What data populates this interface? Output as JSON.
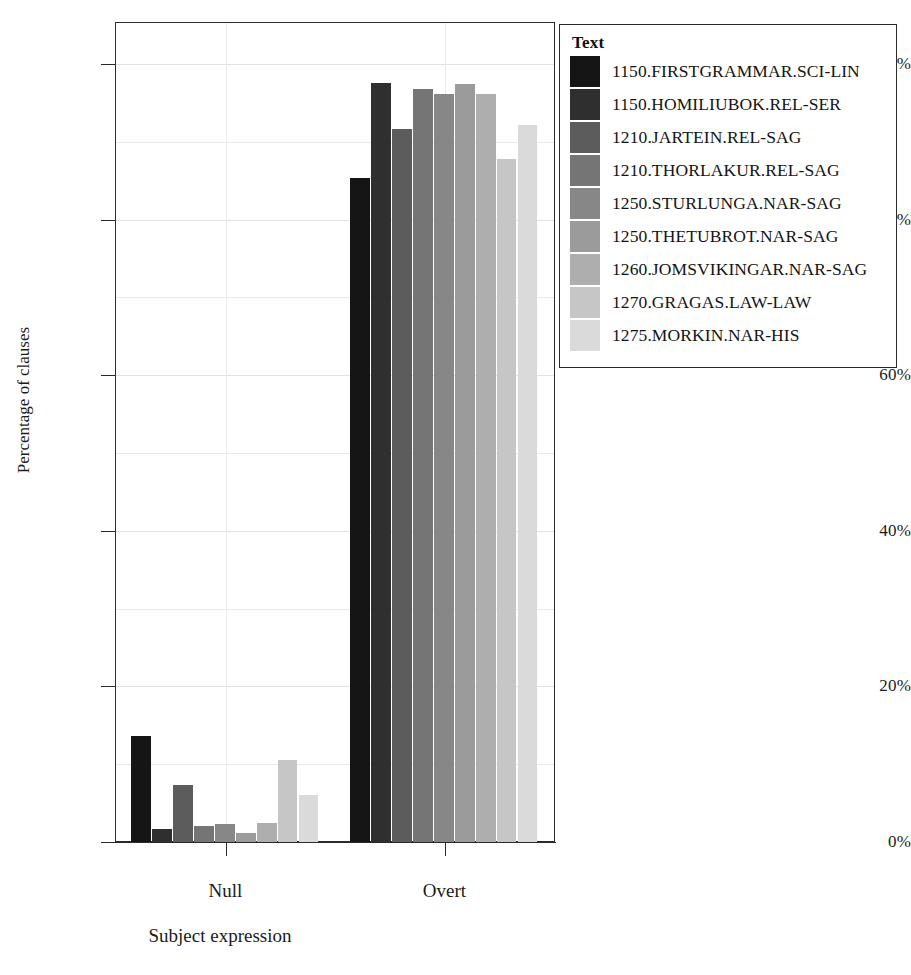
{
  "chart_data": {
    "type": "bar",
    "title": "",
    "xlabel": "Subject expression",
    "ylabel": "Percentage of clauses",
    "categories": [
      "Null",
      "Overt"
    ],
    "ylim": [
      0,
      100
    ],
    "ytick_labels": [
      "0%",
      "20%",
      "40%",
      "60%",
      "80%",
      "100%"
    ],
    "ytick_values": [
      0,
      20,
      40,
      60,
      80,
      100
    ],
    "grid": true,
    "legend_position": "right",
    "legend_title": "Text",
    "series": [
      {
        "name": "1150.FIRSTGRAMMAR.SCI-LIN",
        "color": "#151515",
        "values": [
          13.6,
          85.4
        ]
      },
      {
        "name": "1150.HOMILIUBOK.REL-SER",
        "color": "#2f2f2f",
        "values": [
          1.7,
          97.6
        ]
      },
      {
        "name": "1210.JARTEIN.REL-SAG",
        "color": "#5c5c5c",
        "values": [
          7.3,
          91.6
        ]
      },
      {
        "name": "1210.THORLAKUR.REL-SAG",
        "color": "#757575",
        "values": [
          2.1,
          96.8
        ]
      },
      {
        "name": "1250.STURLUNGA.NAR-SAG",
        "color": "#878787",
        "values": [
          2.3,
          96.2
        ]
      },
      {
        "name": "1250.THETUBROT.NAR-SAG",
        "color": "#9b9b9b",
        "values": [
          1.2,
          97.4
        ]
      },
      {
        "name": "1260.JOMSVIKINGAR.NAR-SAG",
        "color": "#aeaeae",
        "values": [
          2.4,
          96.2
        ]
      },
      {
        "name": "1270.GRAGAS.LAW-LAW",
        "color": "#c6c6c6",
        "values": [
          10.6,
          87.8
        ]
      },
      {
        "name": "1275.MORKIN.NAR-HIS",
        "color": "#dadada",
        "values": [
          6.0,
          92.2
        ]
      }
    ]
  },
  "axes": {
    "y_title": "Percentage of clauses",
    "x_title": "Subject expression"
  },
  "legend": {
    "title": "Text"
  },
  "caption": {
    "fragment": ""
  }
}
